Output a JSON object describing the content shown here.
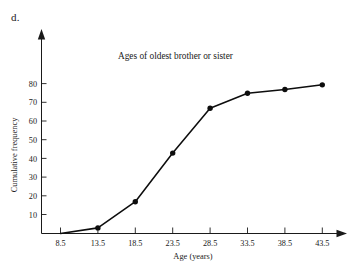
{
  "figure": {
    "part_label": "d."
  },
  "chart_data": {
    "type": "line",
    "title": "Ages of oldest brother or sister",
    "xlabel": "Age (years)",
    "ylabel": "Cumulative frequency",
    "x": [
      8.5,
      13.5,
      18.5,
      23.5,
      28.5,
      33.5,
      38.5,
      43.5
    ],
    "values": [
      0,
      3,
      17,
      43,
      67,
      75,
      77,
      79.5
    ],
    "xtick_labels": [
      "8.5",
      "13.5",
      "18.5",
      "23.5",
      "28.5",
      "33.5",
      "38.5",
      "43.5"
    ],
    "ytick_labels": [
      "10",
      "20",
      "30",
      "40",
      "50",
      "60",
      "70",
      "80"
    ],
    "ytick_values": [
      10,
      20,
      30,
      40,
      50,
      60,
      70,
      80
    ],
    "xlim": [
      8.5,
      43.5
    ],
    "ylim": [
      0,
      90
    ],
    "grid": false,
    "legend": false,
    "marker": "filled-circle",
    "line_color": "#0d0d0d",
    "marker_color": "#0d0d0d",
    "axis_color": "#1a1a1a",
    "background": "#ffffff",
    "axis_arrows": true
  }
}
